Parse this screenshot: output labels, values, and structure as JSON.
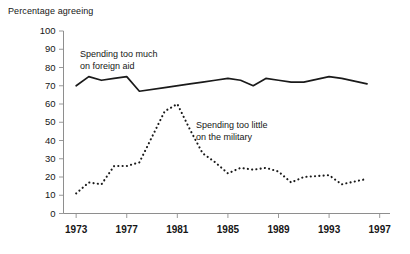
{
  "chart_data": {
    "type": "line",
    "title": "",
    "ylabel": "Percentage agreeing",
    "xlabel": "",
    "ylim": [
      0,
      100
    ],
    "xlim": [
      1972,
      1997.5
    ],
    "grid": false,
    "legend_position": "inline-annotations",
    "yticks": [
      0,
      10,
      20,
      30,
      40,
      50,
      60,
      70,
      80,
      90,
      100
    ],
    "ytick_labels": [
      "0",
      "10",
      "20",
      "30",
      "40",
      "50",
      "60",
      "70",
      "80",
      "90",
      "100"
    ],
    "xticks": [
      1973,
      1977,
      1981,
      1985,
      1989,
      1993,
      1997
    ],
    "xtick_labels": [
      "1973",
      "1977",
      "1981",
      "1985",
      "1989",
      "1993",
      "1997"
    ],
    "series": [
      {
        "name": "Spending too much on foreign aid",
        "style": "solid",
        "color": "#1a1a1a",
        "annotation": "Spending too much\non foreign aid",
        "x": [
          1973,
          1974,
          1975,
          1976,
          1977,
          1978,
          1980,
          1982,
          1983,
          1984,
          1985,
          1986,
          1987,
          1988,
          1989,
          1990,
          1991,
          1993,
          1994,
          1996
        ],
        "values": [
          70,
          75,
          73,
          74,
          75,
          67,
          69,
          71,
          72,
          73,
          74,
          73,
          70,
          74,
          73,
          72,
          72,
          75,
          74,
          71
        ]
      },
      {
        "name": "Spending too little on the military",
        "style": "dotted",
        "color": "#1a1a1a",
        "annotation": "Spending too little\non the military",
        "x": [
          1973,
          1974,
          1975,
          1976,
          1977,
          1978,
          1980,
          1981,
          1982,
          1983,
          1984,
          1985,
          1986,
          1987,
          1988,
          1989,
          1990,
          1991,
          1993,
          1994,
          1996
        ],
        "values": [
          11,
          17,
          16,
          26,
          26,
          28,
          56,
          60,
          46,
          33,
          28,
          22,
          25,
          24,
          25,
          23,
          17,
          20,
          21,
          16,
          19
        ]
      }
    ],
    "annotations": [
      {
        "text": "Spending too much",
        "line2": "on foreign aid",
        "x_px": 80,
        "y_px": 49
      },
      {
        "text": "Spending too little",
        "line2": "on the military",
        "x_px": 196,
        "y_px": 120
      }
    ]
  }
}
